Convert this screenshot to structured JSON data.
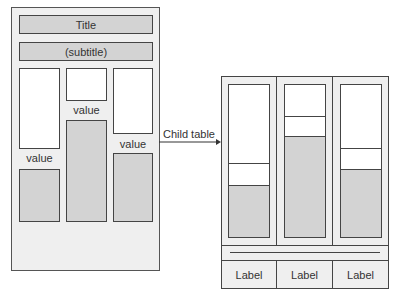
{
  "parent": {
    "title": "Title",
    "subtitle": "(subtitle)",
    "columns": [
      {
        "value_label": "value"
      },
      {
        "value_label": "value"
      },
      {
        "value_label": "value"
      }
    ]
  },
  "connector": {
    "label": "Child table"
  },
  "child_table": {
    "labels": [
      "Label",
      "Label",
      "Label"
    ]
  },
  "colors": {
    "panel_fill": "#efefef",
    "bar_fill": "#d3d3d3",
    "stroke": "#444444"
  }
}
